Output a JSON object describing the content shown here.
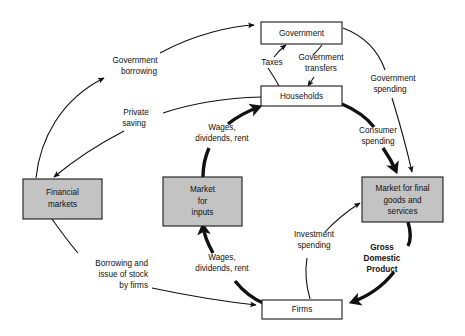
{
  "figure": {
    "type": "circular-flow-diagram"
  },
  "colors": {
    "shaded_box_fill": "#c3c3c3",
    "white_box_fill": "#ffffff",
    "stroke": "#111111",
    "background": "#ffffff"
  },
  "nodes": [
    {
      "id": "government",
      "label": "Government",
      "style": "white"
    },
    {
      "id": "households",
      "label": "Households",
      "style": "white"
    },
    {
      "id": "firms",
      "label": "Firms",
      "style": "white"
    },
    {
      "id": "financial-markets",
      "lines": [
        "Financial",
        "markets"
      ],
      "style": "shaded"
    },
    {
      "id": "market-for-inputs",
      "lines": [
        "Market",
        "for",
        "inputs"
      ],
      "style": "shaded"
    },
    {
      "id": "market-final-goods",
      "lines": [
        "Market for final",
        "goods and",
        "services"
      ],
      "style": "shaded"
    }
  ],
  "flows": [
    {
      "id": "government-borrowing",
      "lines": [
        "Government",
        "borrowing"
      ],
      "weight": "thin"
    },
    {
      "id": "private-saving",
      "lines": [
        "Private",
        "saving"
      ],
      "weight": "thin"
    },
    {
      "id": "taxes",
      "lines": [
        "Taxes"
      ],
      "weight": "thin"
    },
    {
      "id": "government-transfers",
      "lines": [
        "Government",
        "transfers"
      ],
      "weight": "thin"
    },
    {
      "id": "government-spending",
      "lines": [
        "Government",
        "spending"
      ],
      "weight": "thin"
    },
    {
      "id": "consumer-spending",
      "lines": [
        "Consumer",
        "spending"
      ],
      "weight": "thick"
    },
    {
      "id": "wages-dividends-rent-upper",
      "lines": [
        "Wages,",
        "dividends, rent"
      ],
      "weight": "thick"
    },
    {
      "id": "wages-dividends-rent-lower",
      "lines": [
        "Wages,",
        "dividends, rent"
      ],
      "weight": "thick"
    },
    {
      "id": "investment-spending",
      "lines": [
        "Investment",
        "spending"
      ],
      "weight": "thin"
    },
    {
      "id": "borrowing-issue-of-stock",
      "lines": [
        "Borrowing and",
        "issue of stock",
        "by firms"
      ],
      "weight": "thin"
    },
    {
      "id": "gross-domestic-product",
      "lines": [
        "Gross",
        "Domestic",
        "Product"
      ],
      "weight": "thick",
      "bold": true
    }
  ],
  "labels": {
    "government": "Government",
    "households": "Households",
    "firms": "Firms",
    "financial_markets_1": "Financial",
    "financial_markets_2": "markets",
    "market_inputs_1": "Market",
    "market_inputs_2": "for",
    "market_inputs_3": "inputs",
    "market_goods_1": "Market for final",
    "market_goods_2": "goods and",
    "market_goods_3": "services",
    "gov_borrowing_1": "Government",
    "gov_borrowing_2": "borrowing",
    "private_saving_1": "Private",
    "private_saving_2": "saving",
    "taxes": "Taxes",
    "gov_transfers_1": "Government",
    "gov_transfers_2": "transfers",
    "gov_spending_1": "Government",
    "gov_spending_2": "spending",
    "consumer_spending_1": "Consumer",
    "consumer_spending_2": "spending",
    "wages_upper_1": "Wages,",
    "wages_upper_2": "dividends, rent",
    "wages_lower_1": "Wages,",
    "wages_lower_2": "dividends, rent",
    "investment_1": "Investment",
    "investment_2": "spending",
    "borrowing_firms_1": "Borrowing and",
    "borrowing_firms_2": "issue of stock",
    "borrowing_firms_3": "by firms",
    "gdp_1": "Gross",
    "gdp_2": "Domestic",
    "gdp_3": "Product"
  }
}
